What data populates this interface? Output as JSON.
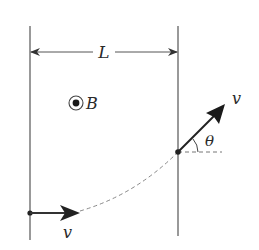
{
  "diagram": {
    "title": "",
    "labels": {
      "width": "L",
      "field": "B",
      "velocity_in": "v",
      "velocity_out": "v",
      "angle": "θ"
    },
    "elements": {
      "left_boundary": {
        "x": 30,
        "y1": 26,
        "y2": 240
      },
      "right_boundary": {
        "x": 178,
        "y1": 26,
        "y2": 236
      },
      "dimension_line": {
        "y": 52,
        "x1": 30,
        "x2": 178,
        "label": "L"
      },
      "magnetic_field_symbol": {
        "type": "out-of-page (dot in circle)",
        "cx": 76,
        "cy": 103,
        "label": "B"
      },
      "entry_point": {
        "x": 30,
        "y": 213
      },
      "exit_point": {
        "x": 178,
        "y": 152
      },
      "trajectory": {
        "style": "dashed",
        "shape": "circular arc"
      },
      "angle_reference": {
        "style": "dashed horizontal",
        "x1": 178,
        "x2": 222,
        "y": 152
      }
    },
    "colors": {
      "line": "#555555",
      "arrow": "#222222",
      "dashed": "#888888",
      "text": "#2a2a2a"
    }
  }
}
